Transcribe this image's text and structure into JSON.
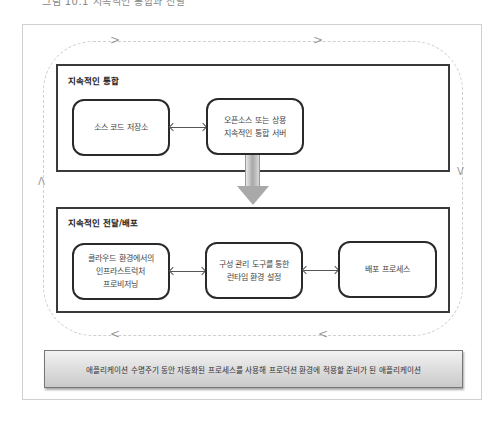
{
  "caption_partial": "그림 10.1 지속적인 통합과 전달",
  "loop_arrows": {
    "top": [
      ">",
      ">"
    ],
    "right": "V",
    "bottom": [
      "<",
      "<"
    ],
    "left": "Λ"
  },
  "sections": [
    {
      "title": "지속적인 통합",
      "nodes": [
        {
          "label": "소스 코드 저장소"
        },
        {
          "label": "오픈소스 또는 상용\n지속적인 통합 서버"
        }
      ]
    },
    {
      "title": "지속적인 전달/배포",
      "nodes": [
        {
          "label": "클라우드 환경에서의\n인프라스트럭처\n프로비저닝"
        },
        {
          "label": "구성 관리 도구를 통한\n런타임 환경 설정"
        },
        {
          "label": "배포 프로세스"
        }
      ]
    }
  ],
  "banner": {
    "text": "애플리케이션 수명주기 동안 자동화된 프로세스를 사용해 프로덕션 환경에 적용할 준비가 된 애플리케이션"
  },
  "colors": {
    "section_border": "#3a3a3a",
    "node_border": "#2a2a2a",
    "loop_dash": "#cfcfcf",
    "banner_top": "#f2f2f2",
    "banner_bottom": "#c9c9c9"
  }
}
